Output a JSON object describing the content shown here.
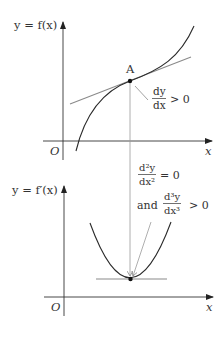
{
  "top_graph": {
    "y_label": "y = f(x)",
    "x_label": "x",
    "origin_label": "O",
    "point_label": "A",
    "annotation": {
      "numerator": "dy",
      "denominator": "dx",
      "relation": "> 0"
    }
  },
  "bottom_graph": {
    "y_label": "y = f′(x)",
    "x_label": "x",
    "origin_label": "O",
    "annotation_second": {
      "numerator": "d²y",
      "denominator": "dx²",
      "relation": "= 0"
    },
    "annotation_third": {
      "prefix": "and",
      "numerator": "d³y",
      "denominator": "dx³",
      "relation": "> 0"
    }
  },
  "colors": {
    "axis": "#333333",
    "curve": "#2a2a2a",
    "tangent": "#8a8a8a",
    "guide": "#9a9a9a",
    "text": "#333333"
  }
}
